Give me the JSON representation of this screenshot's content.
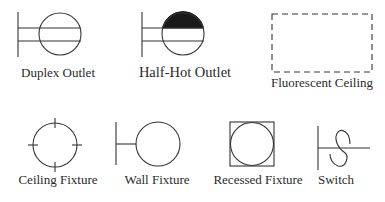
{
  "diagram": {
    "type": "electrical-plan-symbols-legend",
    "colors": {
      "line": "#333333",
      "fill": "#1a1a1a",
      "background": "#ffffff",
      "text": "#2a2a2a"
    },
    "symbols": [
      {
        "id": "duplex-outlet",
        "label": "Duplex Outlet"
      },
      {
        "id": "half-hot-outlet",
        "label": "Half-Hot Outlet"
      },
      {
        "id": "fluorescent-ceiling",
        "label": "Fluorescent Ceiling"
      },
      {
        "id": "ceiling-fixture",
        "label": "Ceiling Fixture"
      },
      {
        "id": "wall-fixture",
        "label": "Wall Fixture"
      },
      {
        "id": "recessed-fixture",
        "label": "Recessed Fixture"
      },
      {
        "id": "switch",
        "label": "Switch"
      }
    ]
  }
}
